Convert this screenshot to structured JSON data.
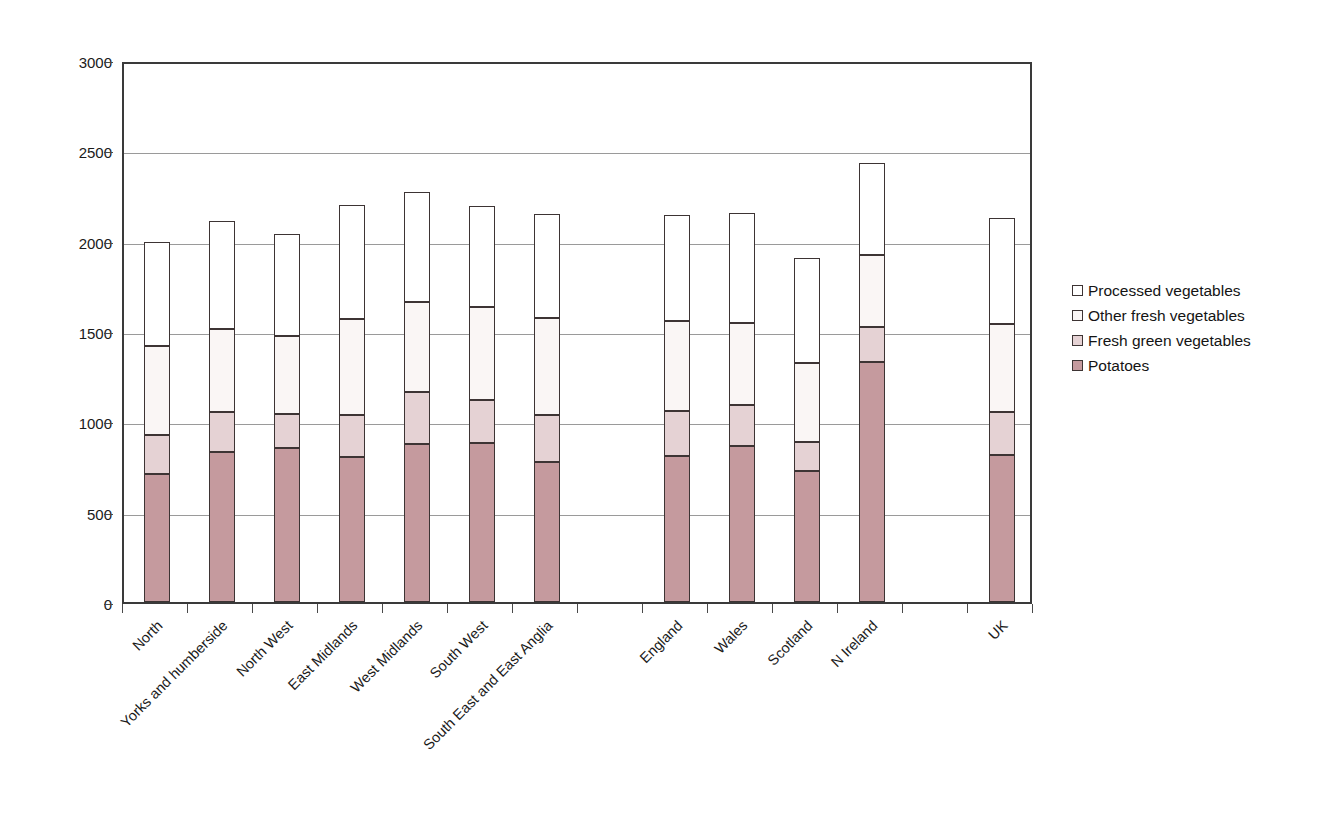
{
  "chart_data": {
    "type": "bar",
    "subtype": "stacked-vertical",
    "title": "",
    "xlabel": "",
    "ylabel": "",
    "ylim": [
      0,
      3000
    ],
    "y_ticks": [
      0,
      500,
      1000,
      1500,
      2000,
      2500,
      3000
    ],
    "y_tick_labels": [
      "0",
      "500",
      "1000",
      "1500",
      "2000",
      "2500",
      "3000"
    ],
    "grid": "horizontal",
    "legend_position": "right",
    "categories": [
      "North",
      "Yorks and humberside",
      "North West",
      "East Midlands",
      "West Midlands",
      "South West",
      "South East and East Anglia",
      "",
      "England",
      "Wales",
      "Scotland",
      "N Ireland",
      "",
      "UK"
    ],
    "series": [
      {
        "name": "Potatoes",
        "color": "#c59a9e",
        "values": [
          710,
          830,
          850,
          800,
          875,
          880,
          775,
          null,
          810,
          865,
          725,
          1330,
          null,
          815
        ]
      },
      {
        "name": "Fresh green vegetables",
        "color": "#e5d2d4",
        "values": [
          215,
          220,
          190,
          235,
          290,
          240,
          260,
          null,
          245,
          225,
          160,
          190,
          null,
          235
        ]
      },
      {
        "name": "Other fresh vegetables",
        "color": "#faf6f5",
        "values": [
          490,
          460,
          435,
          530,
          495,
          515,
          535,
          null,
          500,
          455,
          440,
          400,
          null,
          490
        ]
      },
      {
        "name": "Processed vegetables",
        "color": "#ffffff",
        "values": [
          575,
          600,
          560,
          635,
          610,
          555,
          580,
          null,
          585,
          610,
          580,
          510,
          null,
          585
        ]
      }
    ],
    "totals": [
      1990,
      2110,
      2035,
      2200,
      2270,
      2190,
      2150,
      null,
      2140,
      2155,
      1905,
      2430,
      null,
      2125
    ]
  },
  "legend": {
    "items": [
      {
        "label": "Processed vegetables",
        "key": "processed"
      },
      {
        "label": "Other fresh vegetables",
        "key": "other_fresh"
      },
      {
        "label": "Fresh green vegetables",
        "key": "fresh_green"
      },
      {
        "label": "Potatoes",
        "key": "potatoes"
      }
    ]
  }
}
